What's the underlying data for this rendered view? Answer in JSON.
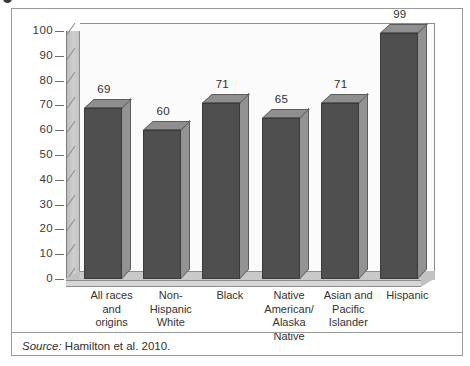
{
  "figure": {
    "source_prefix": "Source:",
    "source_text": " Hamilton et al. 2010."
  },
  "chart_data": {
    "type": "bar",
    "title": "",
    "subtitle": "",
    "xlabel": "",
    "ylabel": "",
    "ylim": [
      0,
      100
    ],
    "grid": false,
    "legend": "none",
    "style": "3d-column",
    "categories": [
      "All races\nand\norigins",
      "Non-\nHispanic\nWhite",
      "Black",
      "Native\nAmerican/\nAlaska\nNative",
      "Asian and\nPacific\nIslander",
      "Hispanic"
    ],
    "category_lines": [
      [
        "All races",
        "and",
        "origins"
      ],
      [
        "Non-",
        "Hispanic",
        "White"
      ],
      [
        "Black"
      ],
      [
        "Native",
        "American/",
        "Alaska",
        "Native"
      ],
      [
        "Asian and",
        "Pacific",
        "Islander"
      ],
      [
        "Hispanic"
      ]
    ],
    "values": [
      69,
      60,
      71,
      65,
      71,
      99
    ],
    "value_labels": [
      "69",
      "60",
      "71",
      "65",
      "71",
      "99"
    ],
    "yticks": [
      100,
      90,
      80,
      70,
      60,
      50,
      40,
      30,
      20,
      10,
      0
    ],
    "ytick_labels": [
      "100",
      "90",
      "80",
      "70",
      "60",
      "50",
      "40",
      "30",
      "20",
      "10",
      "0"
    ],
    "colors": {
      "bar_front": "#4f4f4f",
      "bar_top": "#8f8f8f",
      "bar_side": "#939393",
      "floor": "#c9c9c9",
      "wall": "#c4c4c4",
      "panel": "#fbfbfb",
      "frame": "#9a9a9a"
    }
  }
}
